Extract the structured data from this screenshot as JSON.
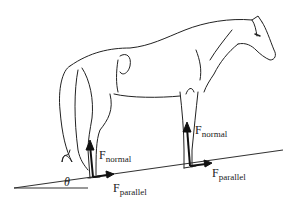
{
  "diagram": {
    "angle_label": "θ",
    "forces": [
      {
        "id": "rear-normal",
        "main": "F",
        "sub": "normal"
      },
      {
        "id": "rear-parallel",
        "main": "F",
        "sub": "parallel"
      },
      {
        "id": "front-normal",
        "main": "F",
        "sub": "normal"
      },
      {
        "id": "front-parallel",
        "main": "F",
        "sub": "parallel"
      }
    ],
    "colors": {
      "line": "#1a1a1a",
      "background": "#ffffff"
    }
  }
}
